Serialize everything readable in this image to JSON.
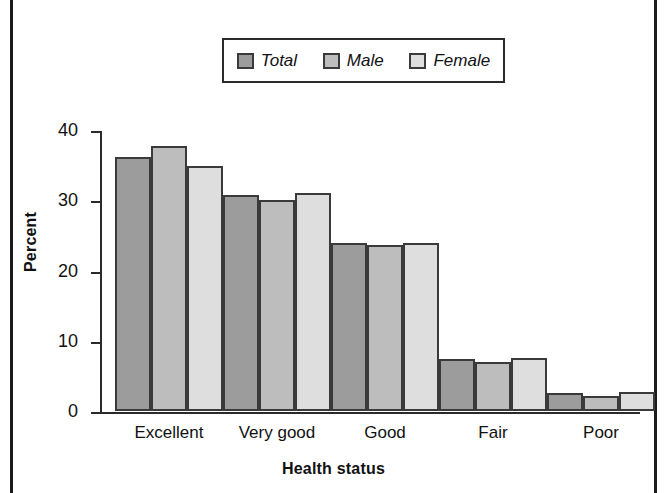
{
  "figure": {
    "background": "#ffffff",
    "frame_color": "#1a1a1a"
  },
  "legend": {
    "position": "top-center",
    "entries": [
      {
        "label": "Total",
        "color": "#9c9c9c"
      },
      {
        "label": "Male",
        "color": "#bdbdbd"
      },
      {
        "label": "Female",
        "color": "#dedede"
      }
    ]
  },
  "axes": {
    "y_title": "Percent",
    "x_title": "Health status",
    "y_ticks": [
      "0",
      "10",
      "20",
      "30",
      "40"
    ]
  },
  "chart_data": {
    "type": "bar",
    "title": "",
    "subtitle": "",
    "xlabel": "Health status",
    "ylabel": "Percent",
    "categories": [
      "Excellent",
      "Very good",
      "Good",
      "Fair",
      "Poor"
    ],
    "series": [
      {
        "name": "Total",
        "color": "#9c9c9c",
        "values": [
          36.2,
          30.7,
          23.9,
          7.4,
          2.5
        ]
      },
      {
        "name": "Male",
        "color": "#bdbdbd",
        "values": [
          37.7,
          30.0,
          23.7,
          7.0,
          2.1
        ]
      },
      {
        "name": "Female",
        "color": "#dedede",
        "values": [
          34.9,
          31.1,
          23.9,
          7.6,
          2.7
        ]
      }
    ],
    "ylim": [
      0,
      40
    ],
    "ytick_values": [
      0,
      10,
      20,
      30,
      40
    ],
    "grid": false,
    "legend_position": "top-center",
    "bar_edge_color": "#3a3a3a"
  }
}
